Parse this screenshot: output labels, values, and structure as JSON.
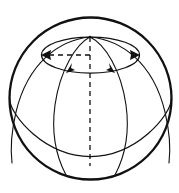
{
  "figure": {
    "background_color": "#ffffff",
    "stroke_color": "#111111",
    "width": 179,
    "height": 193
  },
  "geometry": {
    "sphere": {
      "center_x": 90.5,
      "center_y": 98.5,
      "radius": 81,
      "stroke_width": 2.3
    },
    "pole": {
      "x": 90,
      "y": 37,
      "label": "north-pole-vertex"
    },
    "polar_axis": {
      "x": 90,
      "y_top": 37,
      "y_bottom": 166,
      "dash_pattern": "5 4",
      "style": "dashed"
    },
    "latitude_circle": {
      "center_x": 90.5,
      "center_y": 55,
      "radius_x": 49,
      "radius_y": 18,
      "style": "solid"
    },
    "radius_indicator": {
      "from_x": 90,
      "from_y": 55,
      "to_x": 44,
      "to_y": 55,
      "style": "dashed",
      "dash_pattern": "5 4"
    },
    "equator": {
      "center_x": 90.5,
      "center_y": 128,
      "radius_x": 81,
      "radius_y": 28,
      "visible_half": "front-lower-arc"
    },
    "meridians": [
      {
        "name": "meridian-left-outer",
        "from_pole": true
      },
      {
        "name": "meridian-left-inner",
        "from_pole": true
      },
      {
        "name": "meridian-right-inner",
        "from_pole": true
      },
      {
        "name": "meridian-right-outer",
        "from_pole": true
      }
    ],
    "arrows": [
      {
        "name": "arrow-west",
        "x": 42,
        "y": 55,
        "direction": "left",
        "angle_deg": 180
      },
      {
        "name": "arrow-east",
        "x": 139,
        "y": 55,
        "direction": "right",
        "angle_deg": 0
      },
      {
        "name": "arrow-lower-left",
        "x": 69,
        "y": 70,
        "direction": "down-left",
        "angle_deg": 118
      },
      {
        "name": "arrow-lower-right",
        "x": 112,
        "y": 70,
        "direction": "down-right",
        "angle_deg": 62
      }
    ]
  },
  "chart_data": {
    "type": "diagram",
    "elements": [
      "outer sphere circle outline",
      "small circle of latitude near north pole drawn as ellipse",
      "four meridian arcs converging at the north pole",
      "equator arc curving downward",
      "dashed vertical polar axis",
      "dashed horizontal radius of the latitude circle",
      "two horizontal arrowheads at the latitude circle extremes",
      "two inclined arrowheads on the lower front of the latitude circle"
    ],
    "annotations": []
  }
}
